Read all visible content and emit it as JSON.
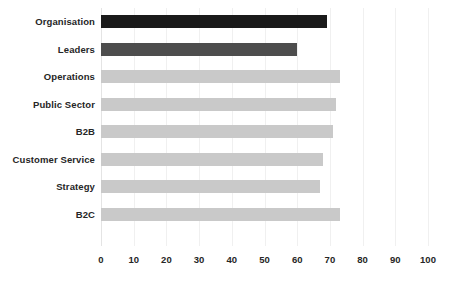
{
  "chart_data": {
    "type": "bar",
    "orientation": "horizontal",
    "title": "",
    "subtitle": "",
    "xlabel": "",
    "ylabel": "",
    "xlim": [
      0,
      100
    ],
    "xticks": [
      "0",
      "10",
      "20",
      "30",
      "40",
      "50",
      "60",
      "70",
      "80",
      "90",
      "100"
    ],
    "xtick_step": 10,
    "grid": "vertical-only",
    "legend": "none",
    "background_color": "#ffffff",
    "categories": [
      "Organisation",
      "Leaders",
      "Operations",
      "Public Sector",
      "B2B",
      "Customer Service",
      "Strategy",
      "B2C"
    ],
    "values": [
      69,
      60,
      73,
      72,
      71,
      68,
      67,
      73
    ],
    "bar_colors": [
      "#1a1a1a",
      "#4d4d4d",
      "#c9c9c9",
      "#c9c9c9",
      "#c9c9c9",
      "#c9c9c9",
      "#c9c9c9",
      "#c9c9c9"
    ],
    "bars": [
      {
        "label": "Organisation",
        "value": 69,
        "color": "#1a1a1a"
      },
      {
        "label": "Leaders",
        "value": 60,
        "color": "#4d4d4d"
      },
      {
        "label": "Operations",
        "value": 73,
        "color": "#c9c9c9"
      },
      {
        "label": "Public Sector",
        "value": 72,
        "color": "#c9c9c9"
      },
      {
        "label": "B2B",
        "value": 71,
        "color": "#c9c9c9"
      },
      {
        "label": "Customer Service",
        "value": 68,
        "color": "#c9c9c9"
      },
      {
        "label": "Strategy",
        "value": 67,
        "color": "#c9c9c9"
      },
      {
        "label": "B2C",
        "value": 73,
        "color": "#c9c9c9"
      }
    ]
  }
}
